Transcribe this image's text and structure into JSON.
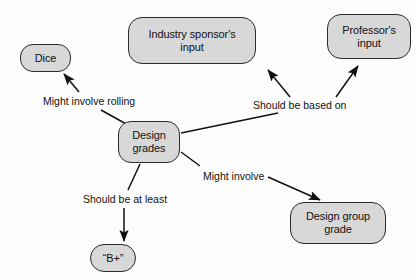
{
  "diagram": {
    "background_color": "#fdfdfd",
    "node_fill_color": "#d8d8d8",
    "node_border_color": "#2b2b2b",
    "text_color": "#111111",
    "nodes": [
      {
        "id": "dice",
        "label": "Dice",
        "x": 20,
        "y": 44,
        "w": 51,
        "h": 28,
        "radius": 13
      },
      {
        "id": "industry-sponsors-input",
        "label": "Industry sponsor's\ninput",
        "x": 128,
        "y": 17,
        "w": 128,
        "h": 47,
        "radius": 14
      },
      {
        "id": "professors-input",
        "label": "Professor's\ninput",
        "x": 327,
        "y": 14,
        "w": 84,
        "h": 45,
        "radius": 14
      },
      {
        "id": "design-grades",
        "label": "Design\ngrades",
        "x": 118,
        "y": 121,
        "w": 62,
        "h": 42,
        "radius": 13
      },
      {
        "id": "b-plus",
        "label": "“B+”",
        "x": 90,
        "y": 244,
        "w": 46,
        "h": 28,
        "radius": 14
      },
      {
        "id": "design-group-grade",
        "label": "Design group\ngrade",
        "x": 290,
        "y": 202,
        "w": 96,
        "h": 42,
        "radius": 14
      }
    ],
    "edges": [
      {
        "id": "design-grades-to-dice",
        "from": "design-grades",
        "to": "dice",
        "label": "Might involve rolling",
        "label_x": 41,
        "label_y": 95
      },
      {
        "id": "design-grades-to-sponsor-and-professor",
        "from": "design-grades",
        "to": "industry-sponsors-input, professors-input",
        "label": "Should be based on",
        "label_x": 251,
        "label_y": 99
      },
      {
        "id": "design-grades-to-b-plus",
        "from": "design-grades",
        "to": "b-plus",
        "label": "Should be at least",
        "label_x": 81,
        "label_y": 193
      },
      {
        "id": "design-grades-to-design-group-grade",
        "from": "design-grades",
        "to": "design-group-grade",
        "label": "Might involve",
        "label_x": 201,
        "label_y": 170
      }
    ]
  }
}
